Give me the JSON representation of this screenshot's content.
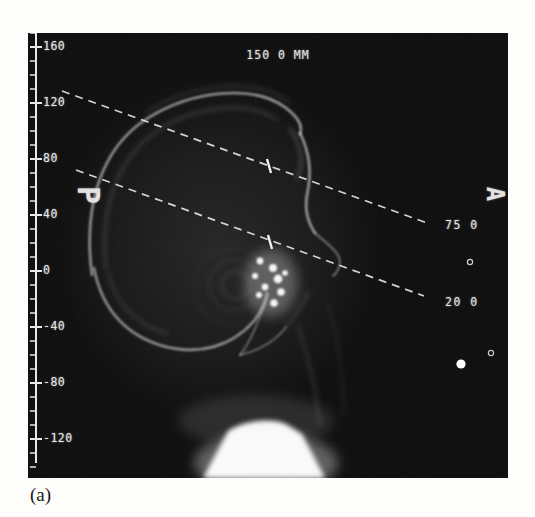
{
  "figure": {
    "caption": "(a)"
  },
  "scout": {
    "scan_width_label": "150 0 MM",
    "orientation": {
      "posterior": "P",
      "anterior": "A"
    },
    "scan_lines": {
      "upper": {
        "position_label": "75 0"
      },
      "lower": {
        "position_label": "20 0"
      }
    },
    "ruler": {
      "labels": [
        "160",
        "120",
        "80",
        "40",
        "0",
        "-40",
        "-80",
        "-120"
      ],
      "top_value": 170,
      "bottom_value": -140,
      "step": 10,
      "label_every": 40
    },
    "markers": {
      "small_circle_upper": "hollow-dot",
      "small_circle_lower": "hollow-dot",
      "filled_dot": "solid-dot"
    },
    "colors": {
      "film_black": "#0b0b0b",
      "overlay_white": "#e2e2e2",
      "bone_gray": "#b8b8b8"
    }
  }
}
